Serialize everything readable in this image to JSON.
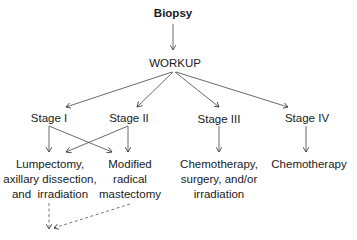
{
  "diagram": {
    "type": "flowchart",
    "nodes": {
      "biopsy": "Biopsy",
      "workup": "WORKUP",
      "stage1": "Stage I",
      "stage2": "Stage II",
      "stage3": "Stage III",
      "stage4": "Stage IV",
      "lumpectomy": [
        "Lumpectomy,",
        "axillary dissection,",
        "and  irradiation"
      ],
      "mastectomy": [
        "Modified",
        "radical",
        "mastectomy"
      ],
      "stage3_treatment": [
        "Chemotherapy,",
        "surgery, and/or",
        "irradiation"
      ],
      "stage4_treatment": "Chemotherapy"
    },
    "edges": [
      {
        "from": "Biopsy",
        "to": "WORKUP",
        "style": "solid"
      },
      {
        "from": "WORKUP",
        "to": "Stage I",
        "style": "solid"
      },
      {
        "from": "WORKUP",
        "to": "Stage II",
        "style": "solid"
      },
      {
        "from": "WORKUP",
        "to": "Stage III",
        "style": "solid"
      },
      {
        "from": "WORKUP",
        "to": "Stage IV",
        "style": "solid"
      },
      {
        "from": "Stage I",
        "to": "Lumpectomy, axillary dissection, and irradiation",
        "style": "solid"
      },
      {
        "from": "Stage I",
        "to": "Modified radical mastectomy",
        "style": "solid"
      },
      {
        "from": "Stage II",
        "to": "Lumpectomy, axillary dissection, and irradiation",
        "style": "solid"
      },
      {
        "from": "Stage II",
        "to": "Modified radical mastectomy",
        "style": "solid"
      },
      {
        "from": "Stage III",
        "to": "Chemotherapy, surgery, and/or irradiation",
        "style": "solid"
      },
      {
        "from": "Stage IV",
        "to": "Chemotherapy",
        "style": "solid"
      },
      {
        "from": "Lumpectomy, axillary dissection, and irradiation",
        "to": "(continues)",
        "style": "dashed"
      },
      {
        "from": "Modified radical mastectomy",
        "to": "(continues)",
        "style": "dashed"
      }
    ]
  }
}
